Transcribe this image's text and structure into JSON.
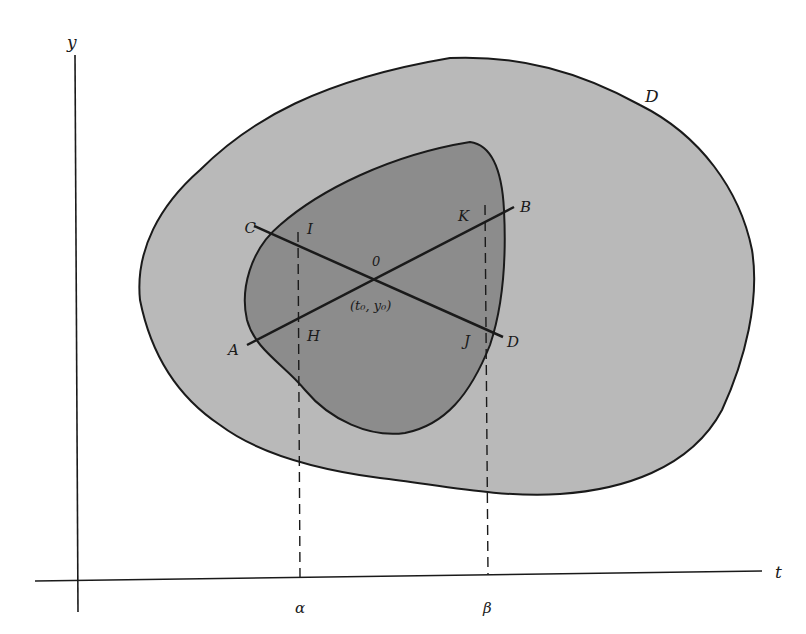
{
  "diagram": {
    "type": "region-in-plane",
    "colors": {
      "background": "#ffffff",
      "outer_region_fill": "#b9b9b9",
      "inner_region_fill": "#8c8c8c",
      "stroke": "#1a1a1a"
    },
    "axes": {
      "y_label": "y",
      "t_label": "t",
      "t_ticks": [
        {
          "label": "α",
          "x": 300
        },
        {
          "label": "β",
          "x": 488
        }
      ]
    },
    "regions": {
      "outer_label": "D"
    },
    "point": {
      "label": "0",
      "coords_label": "(t₀, y₀)"
    },
    "segment_endpoints": {
      "A": "A",
      "B": "B",
      "C": "C",
      "D": "D"
    },
    "intersection_labels": {
      "H": "H",
      "I": "I",
      "J": "J",
      "K": "K"
    }
  }
}
